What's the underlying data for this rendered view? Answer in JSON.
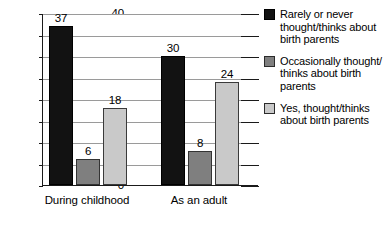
{
  "chart_data": {
    "type": "bar",
    "title": "",
    "xlabel": "",
    "ylabel": "",
    "categories": [
      "During childhood",
      "As an adult"
    ],
    "ylim": [
      0,
      40
    ],
    "ytick_step": 5,
    "ytick_labels": [
      "40",
      "35",
      "30",
      "25",
      "20",
      "15",
      "10",
      "5",
      "0"
    ],
    "grid": true,
    "legend_position": "right",
    "series": [
      {
        "name": "Rarely or never thought/thinks about birth parents",
        "color": "#121212",
        "values": [
          37,
          30
        ]
      },
      {
        "name": "Occasionally thought/thinks about birth parents",
        "color": "#7f7f7f",
        "values": [
          6,
          8
        ]
      },
      {
        "name": "Yes, thought/thinks about birth parents",
        "color": "#c9c9c9",
        "values": [
          18,
          24
        ]
      }
    ],
    "data_labels": [
      [
        "37",
        "6",
        "18"
      ],
      [
        "30",
        "8",
        "24"
      ]
    ]
  },
  "legend": {
    "entries": [
      {
        "line1": "Rarely or never",
        "line2": "thought/thinks about",
        "line3": "birth parents"
      },
      {
        "line1": "Occasionally thought/",
        "line2": "thinks about birth",
        "line3": "parents"
      },
      {
        "line1": "Yes, thought/thinks",
        "line2": "about birth parents",
        "line3": ""
      }
    ]
  }
}
